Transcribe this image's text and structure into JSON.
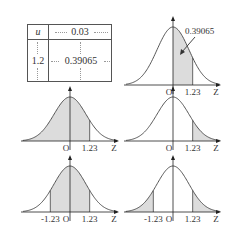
{
  "table": {
    "row_header_label": "u",
    "col_header_value": "0.03",
    "row_value": "1.2",
    "cell_value": "0.39065"
  },
  "labels": {
    "origin": "O",
    "axis": "Z",
    "pos": "1.23",
    "neg": "-1.23",
    "callout": "0.39065"
  },
  "colors": {
    "curve": "#444444",
    "shade": "#dcdcdc",
    "axis": "#222222"
  },
  "chart_data": [
    {
      "type": "area",
      "title": "Standard normal, P(0<Z<1.23)",
      "shade": [
        0,
        1.23
      ],
      "annotation": "0.39065",
      "xticks": [
        "O",
        "1.23"
      ],
      "xlabel": "Z"
    },
    {
      "type": "area",
      "title": "Standard normal, P(Z<1.23)",
      "shade": [
        -4,
        1.23
      ],
      "xticks": [
        "O",
        "1.23"
      ],
      "xlabel": "Z"
    },
    {
      "type": "area",
      "title": "Standard normal, P(Z>1.23)",
      "shade": [
        1.23,
        4
      ],
      "xticks": [
        "O",
        "1.23"
      ],
      "xlabel": "Z"
    },
    {
      "type": "area",
      "title": "Standard normal, P(-1.23<Z<1.23)",
      "shade": [
        -1.23,
        1.23
      ],
      "xticks": [
        "-1.23",
        "O",
        "1.23"
      ],
      "xlabel": "Z"
    },
    {
      "type": "area",
      "title": "Standard normal, P(|Z|>1.23)",
      "shade": [
        [
          -4,
          -1.23
        ],
        [
          1.23,
          4
        ]
      ],
      "xticks": [
        "-1.23",
        "O",
        "1.23"
      ],
      "xlabel": "Z"
    }
  ]
}
